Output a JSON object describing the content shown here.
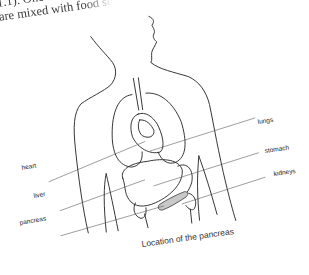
{
  "page_text": {
    "line1": "1.1). One",
    "line2": "are mixed with food so"
  },
  "diagram": {
    "caption": "Location of the pancreas",
    "labels": {
      "lungs": "lungs",
      "heart": "heart",
      "stomach": "stomach",
      "liver": "liver",
      "kidneys": "kidneys",
      "pancreas": "pancreas"
    },
    "colors": {
      "line": "#2a2a2a",
      "pancreas_fill": "#c8c8c8",
      "background": "#ffffff"
    }
  }
}
